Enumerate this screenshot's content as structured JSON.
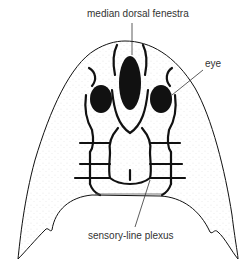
{
  "figure": {
    "type": "anatomical line drawing",
    "labels": {
      "median_dorsal_fenestra": "median dorsal fenestra",
      "eye": "eye",
      "sensory_line_plexus": "sensory-line plexus"
    },
    "caption_partial": ""
  },
  "colors": {
    "ink": "#111111",
    "label_text": "#333333",
    "background": "#ffffff"
  }
}
